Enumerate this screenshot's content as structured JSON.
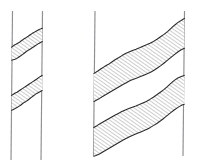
{
  "figure": {
    "background_color": "#ffffff",
    "width": 197,
    "height": 167,
    "line_color": "#8e8e93",
    "bed_outline_color": "#2b2b2b",
    "hatch_color": "#4a4a4a"
  },
  "chart_data": {
    "type": "diagram",
    "xlabel": "",
    "ylabel": "",
    "panels": [
      {
        "name": "narrow-borehole",
        "label": "left-panel",
        "borehole_walls": [
          {
            "name": "left-wall",
            "x_top": 12.5,
            "y_top": 11,
            "x_bottom": 11.0,
            "y_bottom": 160
          },
          {
            "name": "right-wall",
            "x_top": 42.5,
            "y_top": 11,
            "x_bottom": 41.0,
            "y_bottom": 160
          }
        ],
        "beds": [
          {
            "name": "upper-bed",
            "hatch": "diagonal-up-right",
            "top_contact": [
              [
                11.6,
                47.0
              ],
              [
                16.0,
                44.0
              ],
              [
                20.0,
                42.0
              ],
              [
                24.5,
                38.5
              ],
              [
                29.0,
                36.0
              ],
              [
                33.5,
                33.0
              ],
              [
                38.0,
                30.5
              ],
              [
                42.2,
                28.5
              ]
            ],
            "bottom_contact": [
              [
                11.6,
                60.0
              ],
              [
                16.0,
                58.5
              ],
              [
                20.0,
                55.5
              ],
              [
                24.5,
                53.0
              ],
              [
                29.0,
                50.5
              ],
              [
                33.5,
                47.0
              ],
              [
                38.0,
                44.5
              ],
              [
                42.2,
                42.0
              ]
            ],
            "thickness_px": 13,
            "dip_direction": "down-to-the-left"
          },
          {
            "name": "lower-bed",
            "hatch": "diagonal-up-right",
            "top_contact": [
              [
                11.6,
                95.0
              ],
              [
                16.0,
                92.5
              ],
              [
                20.0,
                90.0
              ],
              [
                24.5,
                87.0
              ],
              [
                29.0,
                84.0
              ],
              [
                33.5,
                81.0
              ],
              [
                38.0,
                78.0
              ],
              [
                42.2,
                75.5
              ]
            ],
            "bottom_contact": [
              [
                11.6,
                110.0
              ],
              [
                16.0,
                108.0
              ],
              [
                20.0,
                105.0
              ],
              [
                24.5,
                102.0
              ],
              [
                29.0,
                99.5
              ],
              [
                33.5,
                96.5
              ],
              [
                38.0,
                93.0
              ],
              [
                42.2,
                90.5
              ]
            ],
            "thickness_px": 15,
            "dip_direction": "down-to-the-left"
          }
        ]
      },
      {
        "name": "wide-borehole",
        "label": "right-panel",
        "borehole_walls": [
          {
            "name": "left-wall",
            "x_top": 95.0,
            "y_top": 11,
            "x_bottom": 93.5,
            "y_bottom": 156
          },
          {
            "name": "right-wall",
            "x_top": 184.5,
            "y_top": 11,
            "x_bottom": 183.0,
            "y_bottom": 156
          }
        ],
        "beds": [
          {
            "name": "upper-bed",
            "hatch": "diagonal-up-right",
            "top_contact": [
              [
                94.0,
                73.0
              ],
              [
                104.0,
                66.0
              ],
              [
                114.0,
                59.0
              ],
              [
                124.0,
                53.0
              ],
              [
                134.0,
                49.0
              ],
              [
                144.0,
                45.0
              ],
              [
                154.0,
                41.0
              ],
              [
                164.0,
                35.0
              ],
              [
                174.0,
                27.0
              ],
              [
                184.0,
                19.0
              ]
            ],
            "bottom_contact": [
              [
                94.0,
                101.0
              ],
              [
                104.0,
                96.0
              ],
              [
                114.0,
                89.0
              ],
              [
                124.0,
                83.0
              ],
              [
                134.0,
                79.0
              ],
              [
                144.0,
                75.0
              ],
              [
                154.0,
                70.0
              ],
              [
                164.0,
                64.0
              ],
              [
                174.0,
                56.0
              ],
              [
                184.0,
                48.0
              ]
            ],
            "thickness_px": 28,
            "dip_direction": "down-to-the-left"
          },
          {
            "name": "lower-bed",
            "hatch": "diagonal-up-right",
            "top_contact": [
              [
                94.0,
                127.0
              ],
              [
                104.0,
                122.0
              ],
              [
                114.0,
                116.0
              ],
              [
                124.0,
                111.0
              ],
              [
                134.0,
                107.0
              ],
              [
                144.0,
                103.0
              ],
              [
                154.0,
                98.0
              ],
              [
                164.0,
                92.0
              ],
              [
                174.0,
                84.0
              ],
              [
                184.0,
                76.0
              ]
            ],
            "bottom_contact": [
              [
                94.0,
                156.0
              ],
              [
                104.0,
                152.0
              ],
              [
                114.0,
                146.0
              ],
              [
                124.0,
                140.0
              ],
              [
                134.0,
                136.0
              ],
              [
                144.0,
                131.0
              ],
              [
                154.0,
                126.0
              ],
              [
                164.0,
                120.0
              ],
              [
                174.0,
                112.0
              ],
              [
                184.0,
                104.0
              ]
            ],
            "thickness_px": 29,
            "dip_direction": "down-to-the-left"
          }
        ]
      }
    ],
    "legend": [],
    "annotations": [],
    "grid": false
  }
}
